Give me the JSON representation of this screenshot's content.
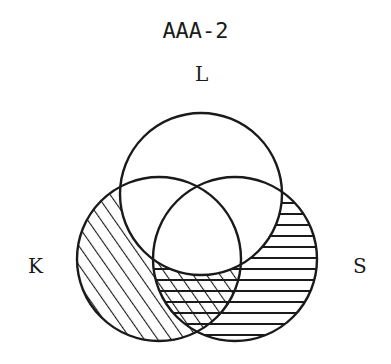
{
  "diagram": {
    "title": "AAA-2",
    "sets": [
      {
        "name": "L",
        "label": "L",
        "cx": 201,
        "cy": 194,
        "r": 81
      },
      {
        "name": "K",
        "label": "K",
        "cx": 159,
        "cy": 259,
        "r": 82
      },
      {
        "name": "S",
        "label": "S",
        "cx": 235,
        "cy": 259,
        "r": 82
      }
    ],
    "shading": [
      {
        "region": "K - L",
        "pattern": "diagonal"
      },
      {
        "region": "S - L",
        "pattern": "horizontal"
      },
      {
        "region": "K ∩ S - L",
        "pattern": "crosshatch"
      }
    ],
    "colors": {
      "stroke": "#1a1a1a",
      "background": "#ffffff"
    }
  }
}
